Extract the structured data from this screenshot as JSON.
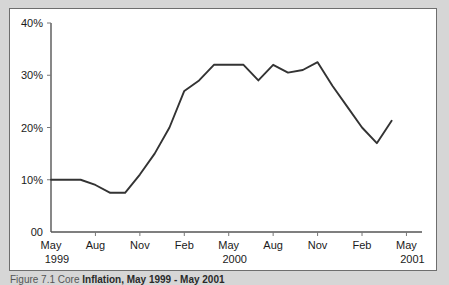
{
  "figure": {
    "caption_lead": "Figure 7.1  Core",
    "caption_main": "Inflation, May 1999 - May 2001"
  },
  "chart_data": {
    "type": "line",
    "title": "",
    "xlabel": "",
    "ylabel": "",
    "ylim": [
      0,
      40
    ],
    "grid": false,
    "legend": "none",
    "line_color": "#333333",
    "y_ticks": [
      0,
      10,
      20,
      30,
      40
    ],
    "y_tick_labels": [
      "00",
      "10%",
      "20%",
      "30%",
      "40%"
    ],
    "x_tick_labels": [
      "May",
      "Aug",
      "Nov",
      "Feb",
      "May",
      "Aug",
      "Nov",
      "Feb",
      "May"
    ],
    "x_year_labels": [
      {
        "text": "1999",
        "tick_index": 0
      },
      {
        "text": "2000",
        "tick_index": 4
      },
      {
        "text": "2001",
        "tick_index": 8
      }
    ],
    "x": [
      "May 1999",
      "Jun 1999",
      "Jul 1999",
      "Aug 1999",
      "Sep 1999",
      "Oct 1999",
      "Nov 1999",
      "Dec 1999",
      "Jan 2000",
      "Feb 2000",
      "Mar 2000",
      "Apr 2000",
      "May 2000",
      "Jun 2000",
      "Jul 2000",
      "Aug 2000",
      "Sep 2000",
      "Oct 2000",
      "Nov 2000",
      "Dec 2000",
      "Jan 2001",
      "Feb 2001",
      "Mar 2001",
      "Apr 2001"
    ],
    "values": [
      10.0,
      10.0,
      10.0,
      9.0,
      7.5,
      7.5,
      11.0,
      15.0,
      20.0,
      27.0,
      29.0,
      32.0,
      32.0,
      32.0,
      29.0,
      32.0,
      30.5,
      31.0,
      32.5,
      28.0,
      24.0,
      20.0,
      17.0,
      21.3
    ],
    "series": [
      {
        "name": "Core Inflation",
        "values": [
          10.0,
          10.0,
          10.0,
          9.0,
          7.5,
          7.5,
          11.0,
          15.0,
          20.0,
          27.0,
          29.0,
          32.0,
          32.0,
          32.0,
          29.0,
          32.0,
          30.5,
          31.0,
          32.5,
          28.0,
          24.0,
          20.0,
          17.0,
          21.3
        ]
      }
    ]
  }
}
